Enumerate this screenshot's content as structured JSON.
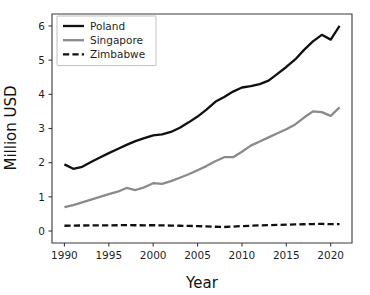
{
  "chart_data": {
    "type": "line",
    "title": "",
    "xlabel": "Year",
    "ylabel": "Million USD",
    "xlim": [
      1988.6,
      2022.4
    ],
    "ylim": [
      -0.35,
      6.35
    ],
    "xticks": [
      1990,
      1995,
      2000,
      2005,
      2010,
      2015,
      2020
    ],
    "yticks": [
      0,
      1,
      2,
      3,
      4,
      5,
      6
    ],
    "xtick_labels": [
      "1990",
      "1995",
      "2000",
      "2005",
      "2010",
      "2015",
      "2020"
    ],
    "ytick_labels": [
      "0",
      "1",
      "2",
      "3",
      "4",
      "5",
      "6"
    ],
    "grid": false,
    "legend_position": "upper left",
    "x": [
      1990,
      1991,
      1992,
      1993,
      1994,
      1995,
      1996,
      1997,
      1998,
      1999,
      2000,
      2001,
      2002,
      2003,
      2004,
      2005,
      2006,
      2007,
      2008,
      2009,
      2010,
      2011,
      2012,
      2013,
      2014,
      2015,
      2016,
      2017,
      2018,
      2019,
      2020,
      2021
    ],
    "series": [
      {
        "name": "Poland",
        "color": "#101010",
        "style": "solid",
        "width": 2.3,
        "values": [
          1.95,
          1.82,
          1.88,
          2.02,
          2.15,
          2.28,
          2.4,
          2.52,
          2.63,
          2.72,
          2.8,
          2.83,
          2.9,
          3.02,
          3.18,
          3.35,
          3.55,
          3.78,
          3.92,
          4.08,
          4.2,
          4.24,
          4.3,
          4.4,
          4.6,
          4.8,
          5.02,
          5.3,
          5.55,
          5.74,
          5.6,
          6.0
        ]
      },
      {
        "name": "Singapore",
        "color": "#8a8a8a",
        "style": "solid",
        "width": 2.3,
        "values": [
          0.7,
          0.76,
          0.84,
          0.92,
          1.0,
          1.08,
          1.15,
          1.26,
          1.2,
          1.28,
          1.4,
          1.38,
          1.46,
          1.56,
          1.66,
          1.78,
          1.9,
          2.04,
          2.16,
          2.16,
          2.32,
          2.5,
          2.62,
          2.74,
          2.86,
          2.98,
          3.12,
          3.32,
          3.5,
          3.48,
          3.37,
          3.62
        ]
      },
      {
        "name": "Zimbabwe",
        "color": "#101010",
        "style": "dashed",
        "width": 2.3,
        "values": [
          0.155,
          0.16,
          0.162,
          0.165,
          0.168,
          0.168,
          0.17,
          0.172,
          0.17,
          0.168,
          0.17,
          0.165,
          0.16,
          0.155,
          0.15,
          0.145,
          0.135,
          0.125,
          0.118,
          0.13,
          0.145,
          0.155,
          0.165,
          0.172,
          0.178,
          0.185,
          0.192,
          0.198,
          0.205,
          0.208,
          0.2,
          0.205
        ]
      }
    ]
  },
  "axes": {
    "ylabel": "Million USD",
    "xlabel": "Year"
  },
  "legend": {
    "entries": [
      {
        "label": "Poland"
      },
      {
        "label": "Singapore"
      },
      {
        "label": "Zimbabwe"
      }
    ]
  }
}
